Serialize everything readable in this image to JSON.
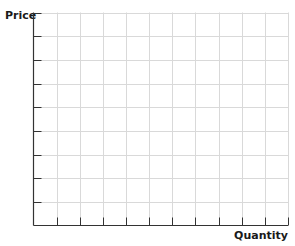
{
  "chart_data": {
    "type": "line",
    "title": "",
    "xlabel": "Quantity",
    "ylabel": "Price",
    "grid": true,
    "x_gridlines": 11,
    "y_gridlines": 9,
    "series": [],
    "x_tick_labels": [],
    "y_tick_labels": [],
    "colors": {
      "axis": "#333333",
      "grid": "#d9d9d9"
    }
  },
  "labels": {
    "cropped_title": "",
    "y_axis": "Price",
    "x_axis": "Quantity"
  }
}
